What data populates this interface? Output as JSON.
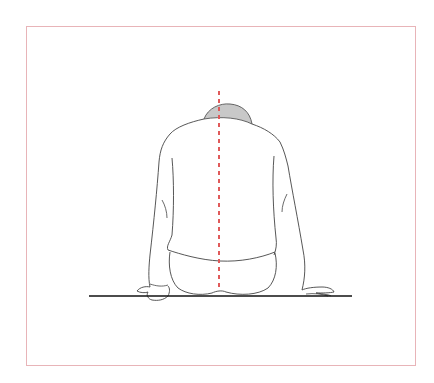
{
  "figure": {
    "description": "Illustration of a seated person viewed from behind, slumped forward with head lowered, hands resting on a surface; a red dashed vertical midline runs along the spine",
    "colors": {
      "frame_border": "#e8b4b8",
      "outline": "#444444",
      "head_fill": "#c8c8c8",
      "midline": "#e05a5a",
      "floor_line": "#111111",
      "background": "#ffffff"
    },
    "elements": {
      "frame": "frame-border",
      "midline": "spine-midline-dashed",
      "figure": "seated-person-back-view",
      "floor": "seating-surface-line"
    }
  }
}
